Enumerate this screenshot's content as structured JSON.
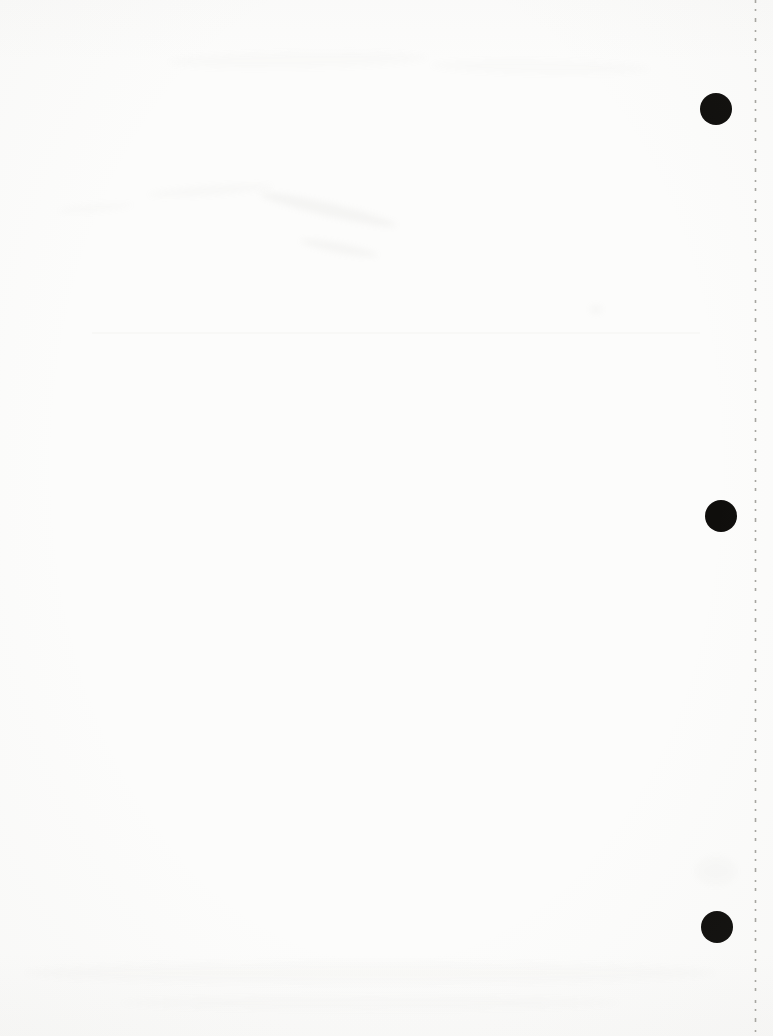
{
  "page": {
    "visible_text": "",
    "colors": {
      "paper": "#fcfcfb",
      "hole_punch": "#0f0e0c",
      "perforation_dash": "#a6a5a0",
      "smudge": "#b4b3ae"
    },
    "punch_holes": [
      {
        "cx": 716,
        "cy": 109,
        "r": 16
      },
      {
        "cx": 721,
        "cy": 516,
        "r": 16
      },
      {
        "cx": 717,
        "cy": 927,
        "r": 16
      }
    ],
    "perforation_line": {
      "x": 755.5,
      "y1": 0,
      "y2": 1036,
      "stroke_width": 1.6,
      "dasharray": "3 6 2 7 4 8 2 6 3 9"
    },
    "crease_line": {
      "x1": 92,
      "x2": 700,
      "y": 333,
      "stroke_width": 1.5,
      "opacity": 0.07
    },
    "smudges": [
      {
        "x": 148,
        "y": 186,
        "w": 125,
        "h": 9,
        "rot": -4,
        "opacity": 0.05
      },
      {
        "x": 58,
        "y": 204,
        "w": 75,
        "h": 8,
        "rot": -5,
        "opacity": 0.04
      },
      {
        "x": 258,
        "y": 203,
        "w": 140,
        "h": 13,
        "rot": 13,
        "opacity": 0.1
      },
      {
        "x": 300,
        "y": 243,
        "w": 78,
        "h": 10,
        "rot": 11,
        "opacity": 0.09
      },
      {
        "x": 168,
        "y": 52,
        "w": 260,
        "h": 16,
        "rot": -1,
        "opacity": 0.035
      },
      {
        "x": 430,
        "y": 60,
        "w": 220,
        "h": 14,
        "rot": 1,
        "opacity": 0.03
      },
      {
        "x": 590,
        "y": 305,
        "w": 12,
        "h": 9,
        "rot": 0,
        "opacity": 0.07
      },
      {
        "x": 695,
        "y": 856,
        "w": 42,
        "h": 30,
        "rot": 0,
        "opacity": 0.04
      },
      {
        "x": 25,
        "y": 962,
        "w": 690,
        "h": 22,
        "rot": 0,
        "opacity": 0.035
      },
      {
        "x": 120,
        "y": 996,
        "w": 500,
        "h": 14,
        "rot": 0,
        "opacity": 0.03
      }
    ]
  }
}
